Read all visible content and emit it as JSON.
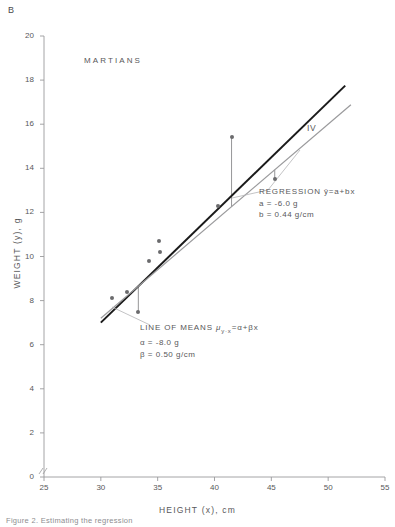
{
  "figure": {
    "panel_label": "B",
    "group_label": "MARTIANS",
    "caption": "Figure 2. Estimating the regression"
  },
  "axes": {
    "x": {
      "title": "HEIGHT (x), cm",
      "ticks": [
        25,
        30,
        35,
        40,
        45,
        50,
        55
      ],
      "min": 25,
      "max": 55,
      "break_at_origin": true
    },
    "y": {
      "title": "WEIGHT (y), g",
      "ticks": [
        0,
        2,
        4,
        6,
        8,
        10,
        12,
        14,
        16,
        18,
        20
      ],
      "min": 0,
      "max": 20,
      "break_at_origin": true
    }
  },
  "annotations": {
    "line_of_means": {
      "title_prefix": "LINE OF MEANS",
      "formula": "μ",
      "formula_sub": "y·x",
      "formula_rest": "=α+βx",
      "param1": "α  =  -8.0 g",
      "param2": "β  =  0.50 g/cm"
    },
    "regression": {
      "title_prefix": "REGRESSION",
      "formula": "ŷ=a+bx",
      "param1": "a  =  -6.0 g",
      "param2": "b  =  0.44 g/cm"
    },
    "iv_label": "IV"
  },
  "colors": {
    "line_of_means": "#1a1a1a",
    "regression": "#9a9a9c",
    "point": "#6b6b6d",
    "axis": "#9a9a9c",
    "deviation": "#8a8a8c",
    "text": "#58585a"
  },
  "chart_data": {
    "type": "scatter",
    "title": "MARTIANS",
    "xlabel": "HEIGHT (x), cm",
    "ylabel": "WEIGHT (y), g",
    "xlim": [
      25,
      55
    ],
    "ylim": [
      0,
      20
    ],
    "xticks": [
      25,
      30,
      35,
      40,
      45,
      50,
      55
    ],
    "yticks": [
      0,
      2,
      4,
      6,
      8,
      10,
      12,
      14,
      16,
      18,
      20
    ],
    "grid": false,
    "legend": "none",
    "points": [
      {
        "x": 31.0,
        "y": 8.1
      },
      {
        "x": 32.3,
        "y": 8.4
      },
      {
        "x": 33.3,
        "y": 7.5
      },
      {
        "x": 34.2,
        "y": 9.8
      },
      {
        "x": 35.1,
        "y": 10.7
      },
      {
        "x": 35.2,
        "y": 10.2
      },
      {
        "x": 40.3,
        "y": 12.3
      },
      {
        "x": 41.5,
        "y": 15.4
      },
      {
        "x": 45.3,
        "y": 13.5
      }
    ],
    "series": [
      {
        "name": "LINE OF MEANS",
        "type": "line",
        "color": "#1a1a1a",
        "intercept": -8.0,
        "slope": 0.5,
        "intercept_units": "g",
        "slope_units": "g/cm",
        "x_start": 30.0,
        "x_end": 51.5
      },
      {
        "name": "REGRESSION",
        "type": "line",
        "color": "#9a9a9c",
        "intercept": -6.0,
        "slope": 0.44,
        "intercept_units": "g",
        "slope_units": "g/cm",
        "x_start": 30.0,
        "x_end": 52.0
      }
    ],
    "deviation_segments": [
      {
        "x": 33.3,
        "y_point": 7.5,
        "y_line": 8.65
      },
      {
        "x": 41.5,
        "y_point": 15.4,
        "y_line": 12.26
      },
      {
        "x": 45.3,
        "y_point": 13.5,
        "y_line": 13.93
      }
    ]
  }
}
